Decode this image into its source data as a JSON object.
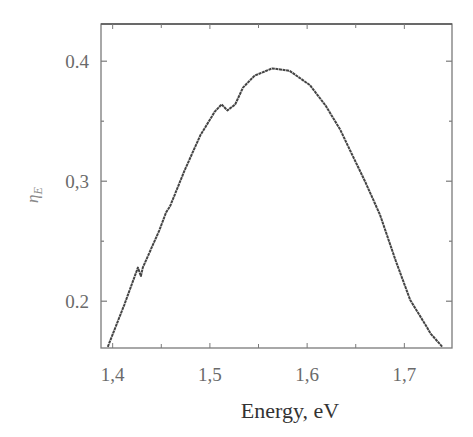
{
  "chart_data": {
    "type": "line",
    "title": "",
    "xlabel": "Energy, eV",
    "ylabel": "ηE",
    "ylabel_main": "η",
    "ylabel_sub": "E",
    "xlim": [
      1.388,
      1.749
    ],
    "ylim": [
      0.161,
      0.431
    ],
    "grid": false,
    "legend": null,
    "x_ticks": [
      1.4,
      1.5,
      1.6,
      1.7
    ],
    "x_tick_labels": [
      "1,4",
      "1,5",
      "1,6",
      "1,7"
    ],
    "x_minor_ticks": [
      1.45,
      1.55,
      1.65
    ],
    "y_ticks": [
      0.2,
      0.3,
      0.4
    ],
    "y_tick_labels": [
      "0.2",
      "0,3",
      "0.4"
    ],
    "y_minor_ticks": [
      0.25,
      0.35
    ],
    "series": [
      {
        "name": "ηE",
        "color": "#444444",
        "x": [
          1.395,
          1.412,
          1.426,
          1.429,
          1.431,
          1.448,
          1.455,
          1.459,
          1.474,
          1.49,
          1.505,
          1.512,
          1.518,
          1.526,
          1.534,
          1.546,
          1.564,
          1.582,
          1.603,
          1.619,
          1.634,
          1.644,
          1.66,
          1.675,
          1.691,
          1.706,
          1.722,
          1.727,
          1.739
        ],
        "y": [
          0.162,
          0.197,
          0.228,
          0.221,
          0.228,
          0.259,
          0.274,
          0.279,
          0.309,
          0.338,
          0.358,
          0.364,
          0.359,
          0.364,
          0.378,
          0.388,
          0.394,
          0.392,
          0.38,
          0.363,
          0.343,
          0.326,
          0.299,
          0.272,
          0.234,
          0.201,
          0.18,
          0.173,
          0.162
        ]
      }
    ]
  },
  "style": {
    "frame_color": "#7a7a7a",
    "line_color": "#444444",
    "tick_label_color": "#6a6a6a"
  }
}
